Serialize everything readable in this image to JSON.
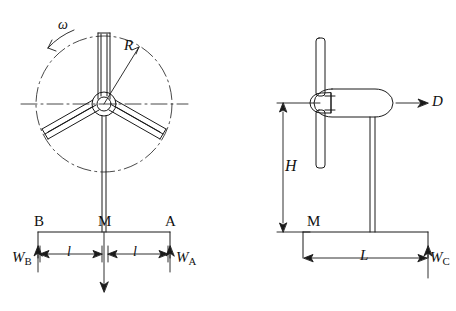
{
  "figure": {
    "title": "",
    "views": [
      {
        "name": "front-view",
        "description": "Three-bladed wind turbine rotor seen from the front with tower and foundation base"
      },
      {
        "name": "side-view",
        "description": "Wind turbine seen from the side with nacelle, rotor, tower and foundation base"
      }
    ]
  },
  "labels": {
    "omega": "ω",
    "rotor_radius": "R",
    "support_B": "B",
    "support_M_front": "M",
    "support_A": "A",
    "reaction_WB_main": "W",
    "reaction_WB_sub": "B",
    "reaction_WA_main": "W",
    "reaction_WA_sub": "A",
    "half_span_left": "l",
    "half_span_right": "l",
    "thrust_D": "D",
    "hub_height_H": "H",
    "support_M_side": "M",
    "base_length_L": "L",
    "reaction_WC_main": "W",
    "reaction_WC_sub": "C"
  },
  "colors": {
    "line": "#1a1a1a",
    "background": "#ffffff"
  }
}
